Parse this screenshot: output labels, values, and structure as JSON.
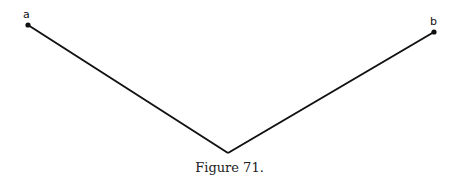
{
  "diagram": {
    "points": [
      {
        "id": "a",
        "label": "a",
        "x": 28,
        "y": 25
      },
      {
        "id": "vertex",
        "label": "",
        "x": 228,
        "y": 153
      },
      {
        "id": "b",
        "label": "b",
        "x": 434,
        "y": 32
      }
    ],
    "segments": [
      [
        "a",
        "vertex"
      ],
      [
        "vertex",
        "b"
      ]
    ],
    "line_color": "#111111",
    "caption": "Figure 71."
  }
}
